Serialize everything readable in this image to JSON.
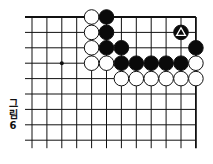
{
  "figure": {
    "caption_chars": [
      "그",
      "림",
      "6"
    ],
    "caption": "그림 6"
  },
  "board": {
    "columns": 12,
    "rows": 9,
    "origin_x": 32,
    "origin_y": 17,
    "spacing_x": 14.9,
    "spacing_y": 15.4,
    "left_overhang": 7,
    "bottom_overhang": 8,
    "top_edge": true,
    "right_edge": true,
    "star_points": [
      [
        2,
        3
      ]
    ],
    "colors": {
      "line": "#111111",
      "black": "#0a0a0a",
      "white": "#ffffff"
    }
  },
  "stones": [
    {
      "col": 4,
      "row": 0,
      "color": "white"
    },
    {
      "col": 5,
      "row": 0,
      "color": "black"
    },
    {
      "col": 4,
      "row": 1,
      "color": "white"
    },
    {
      "col": 5,
      "row": 1,
      "color": "black"
    },
    {
      "col": 10,
      "row": 1,
      "color": "black",
      "marker": "triangle"
    },
    {
      "col": 4,
      "row": 2,
      "color": "white"
    },
    {
      "col": 5,
      "row": 2,
      "color": "black"
    },
    {
      "col": 6,
      "row": 2,
      "color": "black"
    },
    {
      "col": 11,
      "row": 2,
      "color": "black"
    },
    {
      "col": 4,
      "row": 3,
      "color": "white"
    },
    {
      "col": 5,
      "row": 3,
      "color": "white"
    },
    {
      "col": 6,
      "row": 3,
      "color": "black"
    },
    {
      "col": 7,
      "row": 3,
      "color": "black"
    },
    {
      "col": 8,
      "row": 3,
      "color": "black"
    },
    {
      "col": 9,
      "row": 3,
      "color": "black"
    },
    {
      "col": 10,
      "row": 3,
      "color": "black"
    },
    {
      "col": 11,
      "row": 3,
      "color": "white"
    },
    {
      "col": 6,
      "row": 4,
      "color": "white"
    },
    {
      "col": 7,
      "row": 4,
      "color": "white"
    },
    {
      "col": 8,
      "row": 4,
      "color": "white"
    },
    {
      "col": 9,
      "row": 4,
      "color": "white"
    },
    {
      "col": 10,
      "row": 4,
      "color": "white"
    },
    {
      "col": 11,
      "row": 4,
      "color": "white"
    }
  ]
}
